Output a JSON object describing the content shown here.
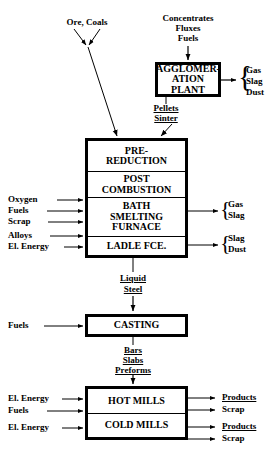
{
  "diagram": {
    "line_color": "#000000",
    "background_color": "#ffffff"
  },
  "feeds": {
    "ore_coals": "Ore, Coals",
    "concentrates": "Concentrates",
    "fluxes": "Fluxes",
    "fuels_top": "Fuels"
  },
  "agglomeration": {
    "line1": "AGGLOMER-",
    "line2": "ATION",
    "line3": "PLANT",
    "outputs": [
      "Gas",
      "Slag",
      "Dust"
    ]
  },
  "intermediates": {
    "pellets": "Pellets",
    "sinter": "Sinter",
    "liquid": "Liquid",
    "steel": "Steel",
    "bars": "Bars",
    "slabs": "Slabs",
    "preforms": "Preforms"
  },
  "furnace": {
    "cells": [
      {
        "lines": [
          "PRE-",
          "REDUCTION"
        ]
      },
      {
        "lines": [
          "POST",
          "COMBUSTION"
        ]
      },
      {
        "lines": [
          "BATH",
          "SMELTING",
          "FURNACE"
        ]
      },
      {
        "lines": [
          "LADLE FCE."
        ]
      }
    ],
    "inputs_upper": [
      "Oxygen",
      "Fuels",
      "Scrap"
    ],
    "inputs_lower": [
      "Alloys",
      "El. Energy"
    ],
    "outputs_upper": [
      "Gas",
      "Slag"
    ],
    "outputs_lower": [
      "Slag",
      "Dust"
    ]
  },
  "casting": {
    "label": "CASTING",
    "input": "Fuels"
  },
  "mills": {
    "hot": "HOT MILLS",
    "cold": "COLD MILLS",
    "hot_inputs": [
      "El. Energy",
      "Fuels"
    ],
    "cold_inputs": [
      "El. Energy"
    ],
    "hot_outputs": [
      "Products",
      "Scrap"
    ],
    "cold_outputs": [
      "Products",
      "Scrap"
    ]
  }
}
